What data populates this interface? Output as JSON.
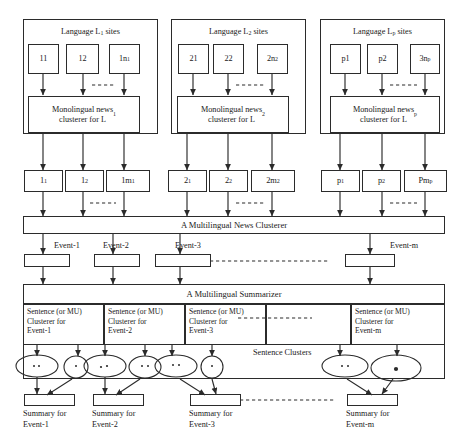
{
  "diagram": {
    "stroke_color": "#2b2b2b",
    "text_color": "#1a1a1a",
    "background": "#ffffff"
  },
  "language_groups": [
    {
      "title": "Language L1 sites",
      "title_html": "Language L<sub>1</sub> sites",
      "sites": [
        "11",
        "12",
        "1n1"
      ],
      "sites_html": [
        "11",
        "12",
        "1n<sub>1</sub>"
      ],
      "clusterer": "Monolingual news clusterer for L1",
      "clusterer_html": "Monolingual news<br>clusterer for L<sub>1</sub>"
    },
    {
      "title": "Language L2 sites",
      "title_html": "Language L<sub>2</sub> sites",
      "sites": [
        "21",
        "22",
        "2n2"
      ],
      "sites_html": [
        "21",
        "22",
        "2n<sub>2</sub>"
      ],
      "clusterer": "Monolingual news clusterer for L2",
      "clusterer_html": "Monolingual news<br>clusterer for L<sub>2</sub>"
    },
    {
      "title": "Language Lp sites",
      "title_html": "Language L<sub>p</sub> sites",
      "sites": [
        "p1",
        "p2",
        "3np"
      ],
      "sites_html": [
        "p1",
        "p2",
        "3n<sub>p</sub>"
      ],
      "clusterer": "Monolingual news clusterer for Lp",
      "clusterer_html": "Monolingual news<br>clusterer for L<sub>p</sub>"
    }
  ],
  "document_clusters": [
    {
      "labels": [
        "11",
        "12",
        "1m1"
      ],
      "labels_html": [
        "1<sub>1</sub>",
        "1<sub>2</sub>",
        "1m<sub>1</sub>"
      ]
    },
    {
      "labels": [
        "21",
        "22",
        "2m2"
      ],
      "labels_html": [
        "2<sub>1</sub>",
        "2<sub>2</sub>",
        "2m<sub>2</sub>"
      ]
    },
    {
      "labels": [
        "p1",
        "p2",
        "Pmp"
      ],
      "labels_html": [
        "p<sub>1</sub>",
        "p<sub>2</sub>",
        "Pm<sub>p</sub>"
      ]
    }
  ],
  "multilingual_clusterer": {
    "label": "A Multilingual News Clusterer"
  },
  "events": [
    {
      "label": "Event-1"
    },
    {
      "label": "Event-2"
    },
    {
      "label": "Event-3"
    },
    {
      "label": "Event-m"
    }
  ],
  "summarizer": {
    "label": "A Multilingual Summarizer",
    "sentence_clusters_label": "Sentence Clusters",
    "cells": [
      {
        "line1": "Sentence (or MU)",
        "line2": "Clusterer  for",
        "line3": "Event-1"
      },
      {
        "line1": "Sentence (or MU)",
        "line2": "Clusterer  for",
        "line3": "Event-2"
      },
      {
        "line1": "Sentence (or MU)",
        "line2": "Clusterer  for",
        "line3": "Event-3"
      },
      {
        "line1": "",
        "line2": "",
        "line3": ""
      },
      {
        "line1": "Sentence (or MU)",
        "line2": "Clusterer  for",
        "line3": "Event-m"
      }
    ]
  },
  "summaries": [
    {
      "line1": "Summary for",
      "line2": "Event-1"
    },
    {
      "line1": "Summary for",
      "line2": "Event-2"
    },
    {
      "line1": "Summary for",
      "line2": "Event-3"
    },
    {
      "line1": "Summary for",
      "line2": "Event-m"
    }
  ]
}
